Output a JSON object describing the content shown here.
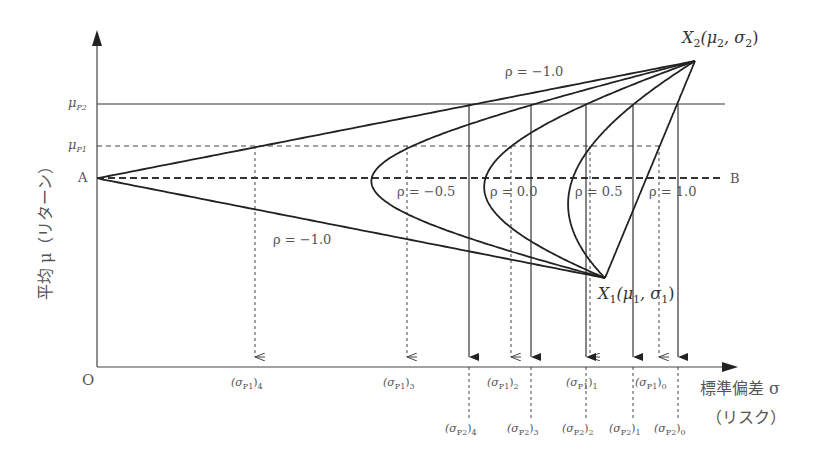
{
  "diagram": {
    "title_hidden": "Portfolio risk-return with correlation coefficient",
    "axes": {
      "origin": "O",
      "y_label": "平均 μ（リターン）",
      "x_label_line1": "標準偏差 σ",
      "x_label_line2": "（リスク）"
    },
    "y_ticks": [
      {
        "id": "mu_p2",
        "label_main": "μ",
        "label_sub": "P2"
      },
      {
        "id": "mu_p1",
        "label_main": "μ",
        "label_sub": "P1"
      },
      {
        "id": "a",
        "label_main": "A",
        "label_sub": ""
      }
    ],
    "points": {
      "x2": {
        "main": "X",
        "idx": "2",
        "open": "(μ",
        "s1": "2",
        "mid": ", σ",
        "s2": "2",
        "close": ")"
      },
      "x1": {
        "main": "X",
        "idx": "1",
        "open": "(μ",
        "s1": "1",
        "mid": ", σ",
        "s2": "1",
        "close": ")"
      },
      "b": "B"
    },
    "rho_labels": [
      {
        "id": "rho_m10_top",
        "text": "ρ = −1.0"
      },
      {
        "id": "rho_m05",
        "text": "ρ = −0.5"
      },
      {
        "id": "rho_00",
        "text": "ρ = 0.0"
      },
      {
        "id": "rho_05",
        "text": "ρ = 0.5"
      },
      {
        "id": "rho_10",
        "text": "ρ = 1.0"
      },
      {
        "id": "rho_m10_bottom",
        "text": "ρ = −1.0"
      }
    ],
    "sigma_p1_labels": [
      {
        "open": "(σ",
        "sub": "P1",
        "close": ")",
        "idx": "4"
      },
      {
        "open": "(σ",
        "sub": "P1",
        "close": ")",
        "idx": "3"
      },
      {
        "open": "(σ",
        "sub": "P1",
        "close": ")",
        "idx": "2"
      },
      {
        "open": "(σ",
        "sub": "P1",
        "close": ")",
        "idx": "1"
      },
      {
        "open": "(σ",
        "sub": "P1",
        "close": ")",
        "idx": "0"
      }
    ],
    "sigma_p2_labels": [
      {
        "open": "(σ",
        "sub": "P2",
        "close": ")",
        "idx": "4"
      },
      {
        "open": "(σ",
        "sub": "P2",
        "close": ")",
        "idx": "3"
      },
      {
        "open": "(σ",
        "sub": "P2",
        "close": ")",
        "idx": "2"
      },
      {
        "open": "(σ",
        "sub": "P2",
        "close": ")",
        "idx": "1"
      },
      {
        "open": "(σ",
        "sub": "P2",
        "close": ")",
        "idx": "0"
      }
    ],
    "colors": {
      "line": "#222222",
      "text": "#555555",
      "dash": "#333333"
    }
  }
}
